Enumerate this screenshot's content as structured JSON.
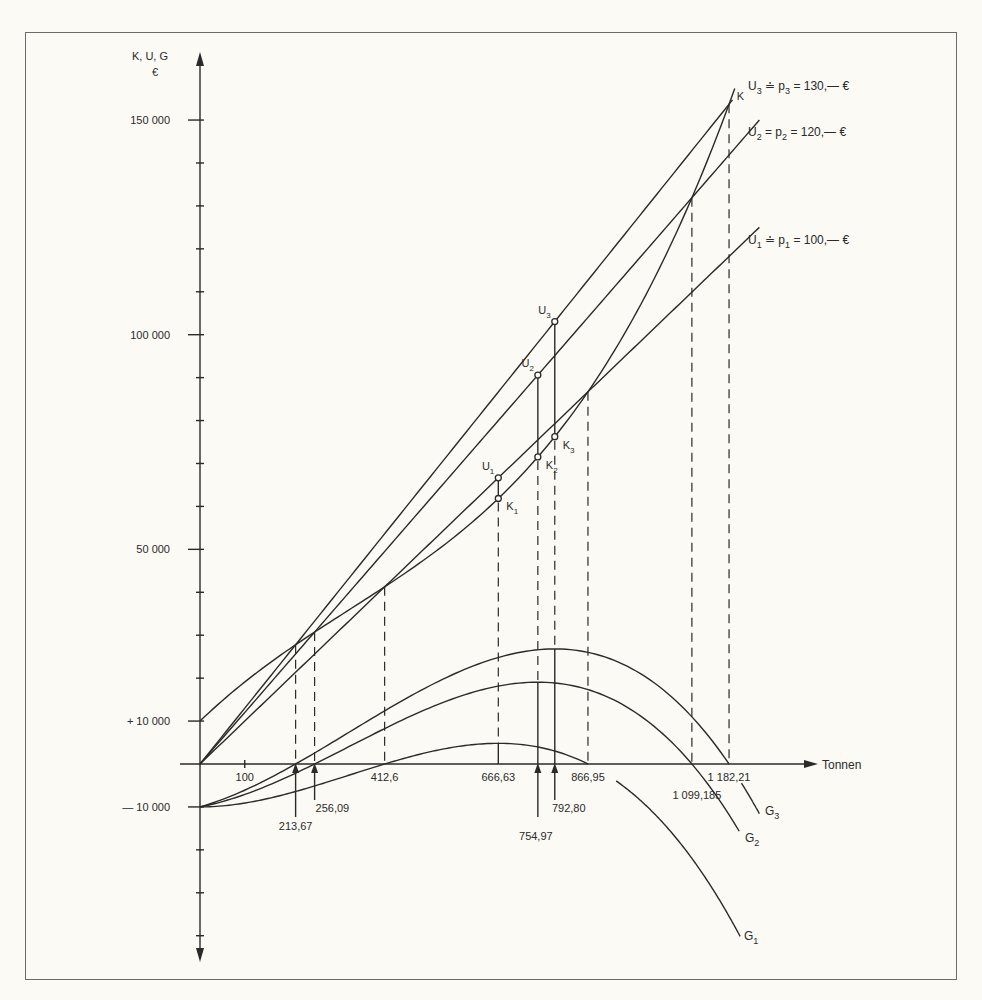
{
  "chart_data": {
    "type": "line",
    "title": "",
    "ylabel": "K, U, G",
    "ylabel_unit": "€",
    "xlabel": "Tonnen",
    "xlim": [
      0,
      1290
    ],
    "ylim": [
      -50000,
      160000
    ],
    "grid": false,
    "legend_position": "inline labels at line ends",
    "y_tick_labels": [
      {
        "value": 150000,
        "label": "150 000"
      },
      {
        "value": 100000,
        "label": "100 000"
      },
      {
        "value": 50000,
        "label": "50 000"
      },
      {
        "value": 10000,
        "label": "+ 10 000"
      },
      {
        "value": -10000,
        "label": "— 10 000"
      }
    ],
    "y_minor_ticks": [
      -40000,
      -30000,
      -20000,
      20000,
      30000,
      40000,
      60000,
      70000,
      80000,
      90000,
      110000,
      120000,
      130000,
      140000
    ],
    "x_tick_labels": [
      {
        "value": 100,
        "label": "100"
      }
    ],
    "cost_function": {
      "name": "K",
      "label": "K",
      "formula": "0.0001x^3 - 0.1x^2 + 100x + 10000",
      "coeffs": {
        "c3": 0.0001,
        "c2": -0.1,
        "c1": 100,
        "c0": 10000
      },
      "x_range": [
        0,
        1195
      ]
    },
    "revenue_lines": [
      {
        "name": "U1",
        "label_main": "U",
        "sub": "1",
        "label_rest": " ≐ p",
        "sub2": "1",
        "label_tail": " = 100,— €",
        "price": 100,
        "x_end": 1250
      },
      {
        "name": "U2",
        "label_main": "U",
        "sub": "2",
        "label_rest": " = p",
        "sub2": "2",
        "label_tail": " = 120,— €",
        "price": 120,
        "x_end": 1250
      },
      {
        "name": "U3",
        "label_main": "U",
        "sub": "3",
        "label_rest": " ≐ p",
        "sub2": "3",
        "label_tail": " = 130,— €",
        "price": 130,
        "x_end": 1190
      }
    ],
    "profit_curves": [
      {
        "name": "G1",
        "label": "G",
        "sub": "1",
        "price": 100,
        "segments": [
          [
            0,
            866.95
          ],
          [
            930,
            1207
          ]
        ],
        "label_pos": [
          744,
          940
        ]
      },
      {
        "name": "G2",
        "label": "G",
        "sub": "2",
        "price": 120,
        "segments": [
          [
            0,
            1205
          ]
        ],
        "label_pos": [
          745,
          842
        ]
      },
      {
        "name": "G3",
        "label": "G",
        "sub": "3",
        "price": 130,
        "segments": [
          [
            0,
            1182.21
          ],
          [
            1210,
            1250
          ]
        ],
        "label_pos": [
          765,
          815
        ]
      }
    ],
    "break_even_points": [
      {
        "x": 213.67,
        "label": "213,67",
        "curve": "U3",
        "arrow": true
      },
      {
        "x": 256.09,
        "label": "256,09",
        "curve": "U2",
        "arrow": true
      },
      {
        "x": 412.6,
        "label": "412,6",
        "curve": "U1",
        "arrow": false
      },
      {
        "x": 866.95,
        "label": "866,95",
        "curve": "U1",
        "arrow": false
      },
      {
        "x": 1099.185,
        "label": "1 099,185",
        "curve": "U2",
        "arrow": false
      },
      {
        "x": 1182.21,
        "label": "1 182,21",
        "curve": "U3",
        "arrow": false
      }
    ],
    "profit_maxima": [
      {
        "x": 666.63,
        "label": "666,63",
        "curve": "G1",
        "U": "U",
        "U_sub": "1",
        "K": "K",
        "K_sub": "1",
        "arrow": false
      },
      {
        "x": 754.97,
        "label": "754,97",
        "curve": "G2",
        "U": "U",
        "U_sub": "2",
        "K": "K",
        "K_sub": "2",
        "arrow": true
      },
      {
        "x": 792.8,
        "label": "792,80",
        "curve": "G3",
        "U": "U",
        "U_sub": "3",
        "K": "K",
        "K_sub": "3",
        "arrow": true
      }
    ]
  }
}
